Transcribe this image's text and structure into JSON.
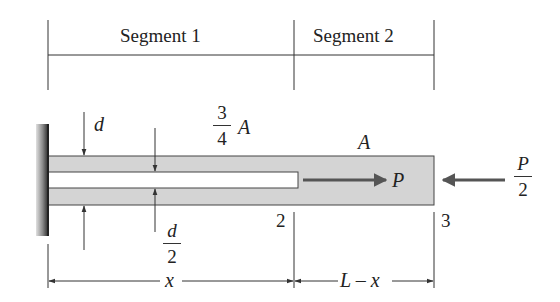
{
  "diagram": {
    "type": "axially loaded bar with internal slot, fixed at left wall",
    "segments": [
      {
        "label": "Segment 1",
        "area_label": {
          "numerator": "3",
          "denominator": "4",
          "symbol": "A"
        }
      },
      {
        "label": "Segment 2",
        "area_label": "A"
      }
    ],
    "dimensions": {
      "outer_thickness": "d",
      "slot_thickness": {
        "numerator": "d",
        "denominator": "2"
      },
      "segment1_length": "x",
      "segment2_length": "L – x"
    },
    "points": [
      "2",
      "3"
    ],
    "loads": [
      {
        "label": "P",
        "direction": "right",
        "location": "end of slot (point 2)"
      },
      {
        "label_numerator": "P",
        "label_denominator": "2",
        "direction": "left",
        "location": "right end (point 3)"
      }
    ],
    "colors": {
      "bar_fill": "#d4d4d4",
      "lines": "#333333",
      "arrows": "#555555",
      "wall_dark": "#3a3a3a",
      "slot_fill": "#ffffff"
    }
  }
}
